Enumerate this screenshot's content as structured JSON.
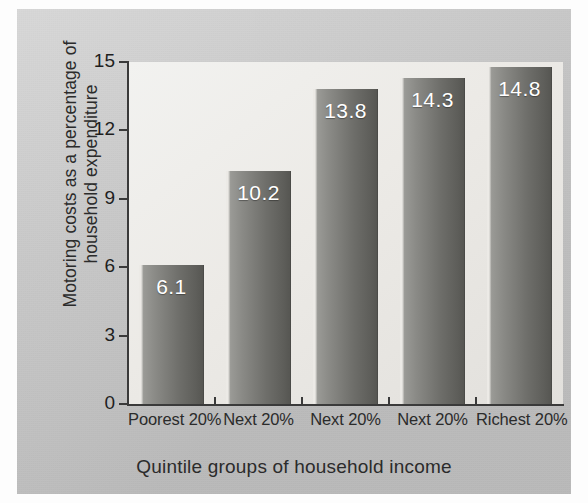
{
  "chart_data": {
    "type": "bar",
    "title": "",
    "xlabel": "Quintile groups of household income",
    "ylabel_lines": [
      "Motoring costs as a percentage of",
      "household expenditure"
    ],
    "ylabel": "Motoring costs as a percentage of household expenditure",
    "categories": [
      "Poorest 20%",
      "Next 20%",
      "Next 20%",
      "Next 20%",
      "Richest 20%"
    ],
    "values": [
      6.1,
      10.2,
      13.8,
      14.3,
      14.8
    ],
    "value_labels": [
      "6.1",
      "10.2",
      "13.8",
      "14.3",
      "14.8"
    ],
    "ylim": [
      0,
      15
    ],
    "yticks": [
      0,
      3,
      6,
      9,
      12,
      15
    ],
    "ytick_labels": [
      "0",
      "3",
      "6",
      "9",
      "12",
      "15"
    ],
    "grid": false,
    "legend": "none",
    "bar_color": "#6e6e6a",
    "plot_background": "#eceae6",
    "panel_background": "#c7c7c7",
    "value_label_color": "#ffffff",
    "axis_color": "#3a3a3a"
  }
}
